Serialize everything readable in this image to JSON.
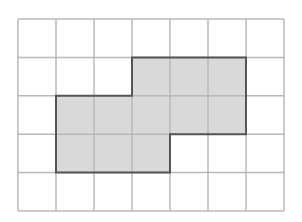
{
  "diagram": {
    "type": "grid-shape",
    "grid": {
      "cols": 7,
      "rows": 5,
      "origin_x": 18,
      "origin_y": 19,
      "cell_w": 38,
      "cell_h": 38.4
    },
    "shaded_cells": [
      [
        1,
        3
      ],
      [
        1,
        4
      ],
      [
        1,
        5
      ],
      [
        2,
        1
      ],
      [
        2,
        2
      ],
      [
        2,
        3
      ],
      [
        2,
        4
      ],
      [
        2,
        5
      ],
      [
        3,
        1
      ],
      [
        3,
        2
      ],
      [
        3,
        3
      ]
    ],
    "outline": [
      [
        3,
        1
      ],
      [
        6,
        1
      ],
      [
        6,
        3
      ],
      [
        4,
        3
      ],
      [
        4,
        4
      ],
      [
        1,
        4
      ],
      [
        1,
        2
      ],
      [
        3,
        2
      ]
    ],
    "colors": {
      "grid_line": "#b8b8b8",
      "fill": "#d9d9d9",
      "outline": "#555555",
      "background": "#ffffff"
    }
  }
}
